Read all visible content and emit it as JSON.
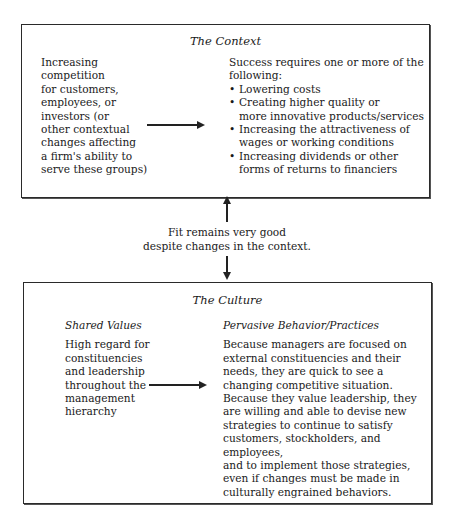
{
  "context": {
    "title": "The Context",
    "left_text": [
      "Increasing",
      "competition",
      "for customers,",
      "employees, or",
      "investors (or",
      "other contextual",
      "changes affecting",
      "a firm's ability to",
      "serve these groups)"
    ],
    "right_intro": [
      "Success requires one or more of the",
      "following:"
    ],
    "bullets": [
      [
        "Lowering costs"
      ],
      [
        "Creating higher quality or",
        "more innovative products/services"
      ],
      [
        "Increasing the attractiveness of",
        "wages or working conditions"
      ],
      [
        "Increasing dividends or other",
        "forms of returns to financiers"
      ]
    ]
  },
  "fit": {
    "line1": "Fit remains very good",
    "line2": "despite changes in the context."
  },
  "culture": {
    "title": "The Culture",
    "left_heading": "Shared Values",
    "left_text": [
      "High regard for",
      "constituencies",
      "and leadership",
      "throughout the",
      "management",
      "hierarchy"
    ],
    "right_heading": "Pervasive Behavior/Practices",
    "right_text": [
      "Because managers are focused on",
      "external constituencies and their",
      "needs, they are quick to see a",
      "changing competitive situation.",
      "Because they value leadership, they",
      "are willing and able to devise new",
      "strategies to continue to satisfy",
      "customers, stockholders, and employees,",
      "and to implement those strategies,",
      "even if changes must be made in",
      "culturally engrained behaviors."
    ]
  }
}
